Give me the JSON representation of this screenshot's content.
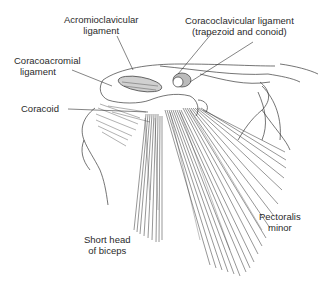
{
  "figure": {
    "labels": {
      "acromioclavicular": [
        "Acromioclavicular",
        "ligament"
      ],
      "coracoclavicular": [
        "Coracoclavicular ligament",
        "(trapezoid and conoid)"
      ],
      "coracoacromial": [
        "Coracoacromial",
        "ligament"
      ],
      "coracoid": [
        "Coracoid"
      ],
      "short_head_biceps": [
        "Short head",
        "of biceps"
      ],
      "pectoralis_minor": [
        "Pectoralis",
        "minor"
      ]
    },
    "colors": {
      "ink": "#2a2a2a",
      "line": "#3a3a3a",
      "background": "#ffffff"
    }
  }
}
